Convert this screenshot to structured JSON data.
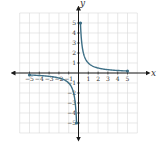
{
  "chart_data": {
    "type": "line",
    "title": "",
    "function": "y = 1/x",
    "xlabel": "x",
    "ylabel": "y",
    "xlim": [
      -6,
      6
    ],
    "ylim": [
      -6,
      6
    ],
    "grid": true,
    "x_ticks": [
      -5,
      -4,
      -3,
      -2,
      -1,
      1,
      2,
      3,
      4,
      5
    ],
    "y_ticks": [
      -5,
      -4,
      -3,
      -2,
      -1,
      1,
      2,
      3,
      4,
      5
    ],
    "series": [
      {
        "name": "right branch",
        "x": [
          0.2,
          0.25,
          0.333,
          0.5,
          0.75,
          1,
          1.5,
          2,
          2.5,
          3,
          3.5,
          4,
          4.5,
          5
        ],
        "y": [
          5,
          4,
          3,
          2,
          1.333,
          1,
          0.667,
          0.5,
          0.4,
          0.333,
          0.286,
          0.25,
          0.222,
          0.2
        ],
        "endpoints": [
          [
            0.2,
            5
          ],
          [
            5,
            0.2
          ]
        ]
      },
      {
        "name": "left branch",
        "x": [
          -5,
          -4.5,
          -4,
          -3.5,
          -3,
          -2.5,
          -2,
          -1.5,
          -1,
          -0.75,
          -0.5,
          -0.333,
          -0.25,
          -0.2
        ],
        "y": [
          -0.2,
          -0.222,
          -0.25,
          -0.286,
          -0.333,
          -0.4,
          -0.5,
          -0.667,
          -1,
          -1.333,
          -2,
          -3,
          -4,
          -5
        ],
        "endpoints": [
          [
            -5,
            -0.2
          ],
          [
            -0.2,
            -5
          ]
        ]
      }
    ],
    "colors": {
      "curve": "#3d6f86",
      "axis": "#1a1a1a",
      "grid": "#d9d9d9"
    }
  }
}
